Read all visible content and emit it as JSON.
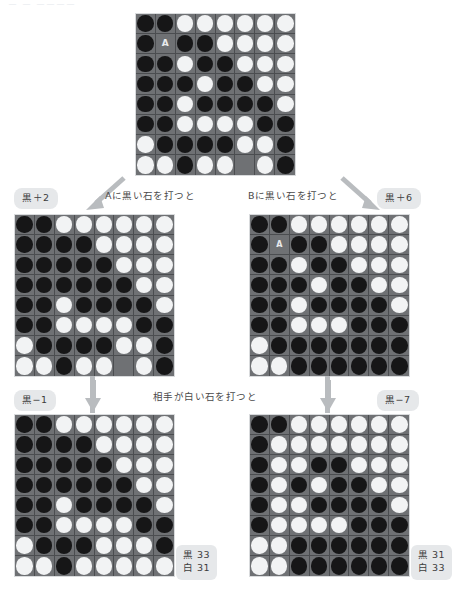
{
  "header": {
    "faint_text": "ー ー  ーーーー"
  },
  "captions": {
    "move_a": "Aに黒い石を打つと",
    "move_b": "Bに黒い石を打つと",
    "opponent_white": "相手が白い石を打つと"
  },
  "pills": {
    "mid_left": "黒＋2",
    "mid_right": "黒＋6",
    "bot_left": "黒−1",
    "bot_right": "黒−7"
  },
  "scores": {
    "bot_left": {
      "black": "黒 33",
      "white": "白 31"
    },
    "bot_right": {
      "black": "黒 31",
      "white": "白 33"
    }
  },
  "colors": {
    "black_stone": "#161617",
    "white_stone": "#f2f3f4",
    "board_bg": "#6f7174",
    "grid_line": "#4b4d50",
    "pill_bg": "#e6e8ea",
    "marker_cell_bg": "#6f7174",
    "text": "#4a4a4a",
    "arrow": "#b9bcbf"
  },
  "icons": {
    "arrow_diag_left": "arrow-diagonal-down-left-icon",
    "arrow_diag_right": "arrow-diagonal-down-right-icon",
    "arrow_down": "arrow-down-icon"
  },
  "boards": {
    "top": {
      "label": "初期局面",
      "markers": {
        "A": [
          1,
          1
        ],
        "B": [
          7,
          5
        ]
      },
      "rows": [
        [
          "B",
          "B",
          "W",
          "W",
          "W",
          "W",
          "W",
          "W"
        ],
        [
          "B",
          "A",
          "B",
          "B",
          "W",
          "W",
          "W",
          "W"
        ],
        [
          "B",
          "B",
          "W",
          "B",
          "B",
          "W",
          "W",
          "W"
        ],
        [
          "B",
          "B",
          "B",
          "W",
          "B",
          "B",
          "W",
          "W"
        ],
        [
          "B",
          "B",
          "W",
          "B",
          "B",
          "B",
          "B",
          "W"
        ],
        [
          "B",
          "B",
          "W",
          "W",
          "W",
          "W",
          "B",
          "B"
        ],
        [
          "W",
          "B",
          "B",
          "B",
          "B",
          "W",
          "W",
          "B"
        ],
        [
          "W",
          "W",
          "B",
          "W",
          "W",
          "M",
          "W",
          "B"
        ]
      ]
    },
    "mid_left": {
      "label": "Aに打った後",
      "markers": {
        "B": [
          7,
          5
        ]
      },
      "rows": [
        [
          "B",
          "B",
          "W",
          "W",
          "W",
          "W",
          "W",
          "W"
        ],
        [
          "B",
          "B",
          "B",
          "B",
          "W",
          "W",
          "W",
          "W"
        ],
        [
          "B",
          "B",
          "B",
          "B",
          "B",
          "W",
          "W",
          "W"
        ],
        [
          "B",
          "B",
          "B",
          "B",
          "B",
          "B",
          "W",
          "W"
        ],
        [
          "B",
          "B",
          "W",
          "B",
          "B",
          "B",
          "B",
          "W"
        ],
        [
          "B",
          "B",
          "W",
          "W",
          "W",
          "W",
          "B",
          "B"
        ],
        [
          "W",
          "B",
          "B",
          "B",
          "B",
          "W",
          "W",
          "B"
        ],
        [
          "W",
          "W",
          "B",
          "W",
          "W",
          "M",
          "W",
          "B"
        ]
      ]
    },
    "mid_right": {
      "label": "Bに打った後",
      "markers": {
        "A": [
          1,
          1
        ]
      },
      "rows": [
        [
          "B",
          "B",
          "W",
          "W",
          "W",
          "W",
          "W",
          "W"
        ],
        [
          "B",
          "A",
          "B",
          "B",
          "W",
          "W",
          "W",
          "W"
        ],
        [
          "B",
          "B",
          "W",
          "B",
          "B",
          "W",
          "W",
          "W"
        ],
        [
          "B",
          "B",
          "B",
          "W",
          "B",
          "B",
          "W",
          "W"
        ],
        [
          "B",
          "B",
          "W",
          "B",
          "B",
          "B",
          "B",
          "W"
        ],
        [
          "B",
          "B",
          "W",
          "W",
          "W",
          "B",
          "B",
          "B"
        ],
        [
          "W",
          "B",
          "B",
          "B",
          "B",
          "B",
          "B",
          "B"
        ],
        [
          "W",
          "W",
          "B",
          "B",
          "B",
          "B",
          "B",
          "B"
        ]
      ]
    },
    "bot_left": {
      "label": "白が応手した後",
      "markers": {},
      "rows": [
        [
          "B",
          "B",
          "W",
          "W",
          "W",
          "W",
          "W",
          "W"
        ],
        [
          "B",
          "B",
          "B",
          "B",
          "W",
          "W",
          "W",
          "W"
        ],
        [
          "B",
          "B",
          "B",
          "B",
          "B",
          "W",
          "W",
          "W"
        ],
        [
          "B",
          "B",
          "B",
          "B",
          "B",
          "B",
          "W",
          "W"
        ],
        [
          "B",
          "B",
          "W",
          "B",
          "B",
          "B",
          "B",
          "W"
        ],
        [
          "B",
          "B",
          "W",
          "W",
          "W",
          "W",
          "B",
          "B"
        ],
        [
          "W",
          "B",
          "B",
          "B",
          "W",
          "W",
          "W",
          "B"
        ],
        [
          "W",
          "W",
          "B",
          "W",
          "W",
          "W",
          "W",
          "W"
        ]
      ]
    },
    "bot_right": {
      "label": "白が応手した後",
      "markers": {},
      "rows": [
        [
          "B",
          "B",
          "W",
          "W",
          "W",
          "W",
          "W",
          "W"
        ],
        [
          "B",
          "W",
          "W",
          "W",
          "W",
          "W",
          "W",
          "W"
        ],
        [
          "B",
          "W",
          "W",
          "B",
          "B",
          "W",
          "W",
          "W"
        ],
        [
          "B",
          "W",
          "B",
          "W",
          "B",
          "B",
          "W",
          "W"
        ],
        [
          "B",
          "W",
          "W",
          "B",
          "B",
          "B",
          "B",
          "W"
        ],
        [
          "B",
          "W",
          "W",
          "W",
          "W",
          "B",
          "B",
          "B"
        ],
        [
          "W",
          "W",
          "B",
          "B",
          "B",
          "B",
          "B",
          "B"
        ],
        [
          "W",
          "W",
          "B",
          "B",
          "B",
          "B",
          "B",
          "B"
        ]
      ]
    }
  }
}
